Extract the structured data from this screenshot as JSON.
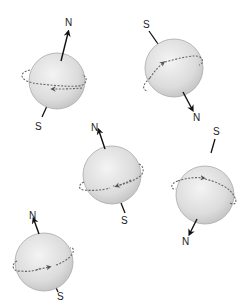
{
  "diagram": {
    "type": "random-spin-orientations",
    "colors": {
      "sphere_fill_light": "#efefef",
      "sphere_fill_dark": "#c8c8c8",
      "sphere_stroke": "#a8a8a8",
      "arrow": "#111111",
      "orbit": "#666666",
      "label": "#222222"
    },
    "spins": [
      {
        "id": 1,
        "north_label": "N",
        "south_label": "S",
        "north_end": "top",
        "south_end": "bottom"
      },
      {
        "id": 2,
        "north_label": "N",
        "south_label": "S",
        "north_end": "bottom",
        "south_end": "top"
      },
      {
        "id": 3,
        "north_label": "N",
        "south_label": "S",
        "north_end": "top",
        "south_end": "bottom"
      },
      {
        "id": 4,
        "north_label": "N",
        "south_label": "S",
        "north_end": "bottom",
        "south_end": "top"
      },
      {
        "id": 5,
        "north_label": "N",
        "south_label": "S",
        "north_end": "top",
        "south_end": "bottom"
      }
    ]
  }
}
